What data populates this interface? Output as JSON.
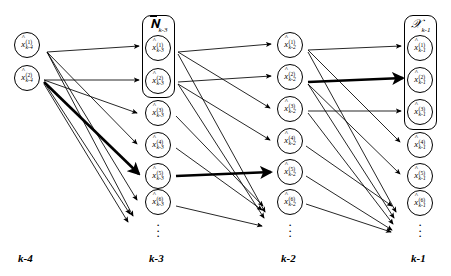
{
  "figure": {
    "width": 451,
    "height": 276,
    "background": "#ffffff",
    "stroke": "#000000"
  },
  "columns": [
    {
      "key": "k-4",
      "axis_label": "k-4",
      "x": 27,
      "label_x": 18,
      "label_y": 252,
      "group": null,
      "has_ellipsis": false,
      "nodes": [
        {
          "index": "1",
          "time": "k-4",
          "symbol": "x",
          "accent": "hat",
          "cx": 27,
          "cy": 45
        },
        {
          "index": "2",
          "time": "k-4",
          "symbol": "x",
          "accent": "hat",
          "cx": 27,
          "cy": 78
        }
      ]
    },
    {
      "key": "k-3",
      "axis_label": "k-3",
      "x": 158,
      "label_x": 149,
      "label_y": 252,
      "group": {
        "label": "N",
        "label_accent": "overbar",
        "subscript": "k-3",
        "covers": [
          1,
          2
        ],
        "box_x": 142,
        "box_y": 15,
        "box_w": 33,
        "box_h": 83
      },
      "has_ellipsis": true,
      "ellipsis_y": 219,
      "nodes": [
        {
          "index": "1",
          "time": "k-3",
          "symbol": "x",
          "accent": "hat",
          "cx": 158,
          "cy": 48
        },
        {
          "index": "2",
          "time": "k-3",
          "symbol": "x",
          "accent": "hat",
          "cx": 158,
          "cy": 81
        },
        {
          "index": "3",
          "time": "k-3",
          "symbol": "x",
          "accent": "hat",
          "cx": 158,
          "cy": 113
        },
        {
          "index": "4",
          "time": "k-3",
          "symbol": "x",
          "accent": "hat",
          "cx": 158,
          "cy": 145
        },
        {
          "index": "5",
          "time": "k-3",
          "symbol": "x",
          "accent": "hat",
          "cx": 158,
          "cy": 176
        },
        {
          "index": "6",
          "time": "k-3",
          "symbol": "x",
          "accent": "hat",
          "cx": 158,
          "cy": 202
        }
      ]
    },
    {
      "key": "k-2",
      "axis_label": "k-2",
      "x": 290,
      "label_x": 281,
      "label_y": 252,
      "group": null,
      "has_ellipsis": true,
      "ellipsis_y": 219,
      "nodes": [
        {
          "index": "1",
          "time": "k-2",
          "symbol": "x",
          "accent": "hat",
          "cx": 290,
          "cy": 45
        },
        {
          "index": "2",
          "time": "k-2",
          "symbol": "x",
          "accent": "hat",
          "cx": 290,
          "cy": 77
        },
        {
          "index": "3",
          "time": "k-2",
          "symbol": "x",
          "accent": "hat",
          "cx": 290,
          "cy": 109
        },
        {
          "index": "4",
          "time": "k-2",
          "symbol": "x",
          "accent": "hat",
          "cx": 290,
          "cy": 141
        },
        {
          "index": "5",
          "time": "k-2",
          "symbol": "x",
          "accent": "hat",
          "cx": 290,
          "cy": 172
        },
        {
          "index": "6",
          "time": "k-2",
          "symbol": "x",
          "accent": "hat",
          "cx": 290,
          "cy": 202
        }
      ]
    },
    {
      "key": "k-1",
      "axis_label": "k-1",
      "x": 420,
      "label_x": 411,
      "label_y": 252,
      "group": {
        "label": "X",
        "label_accent": "script",
        "subscript": "k-1",
        "covers": [
          1,
          2,
          3
        ],
        "box_x": 404,
        "box_y": 15,
        "box_w": 33,
        "box_h": 115
      },
      "has_ellipsis": true,
      "ellipsis_y": 219,
      "nodes": [
        {
          "index": "1",
          "time": "k-1",
          "symbol": "x",
          "accent": "hat",
          "cx": 420,
          "cy": 48
        },
        {
          "index": "2",
          "time": "k-1",
          "symbol": "x",
          "accent": "hat",
          "cx": 420,
          "cy": 80
        },
        {
          "index": "3",
          "time": "k-1",
          "symbol": "x",
          "accent": "hat",
          "cx": 420,
          "cy": 112
        },
        {
          "index": "4",
          "time": "k-1",
          "symbol": "x",
          "accent": "hat",
          "cx": 420,
          "cy": 145
        },
        {
          "index": "5",
          "time": "k-1",
          "symbol": "x",
          "accent": "hat",
          "cx": 420,
          "cy": 176
        },
        {
          "index": "6",
          "time": "k-1",
          "symbol": "x",
          "accent": "hat",
          "cx": 420,
          "cy": 203
        }
      ]
    }
  ],
  "edges": [
    {
      "from": "k-4.1",
      "to": "k-3.1",
      "x1": 47,
      "y1": 52,
      "x2": 139,
      "y2": 46,
      "weight": "thin"
    },
    {
      "from": "k-4.1",
      "to": "k-3.4",
      "x1": 47,
      "y1": 52,
      "x2": 137,
      "y2": 144,
      "weight": "thin"
    },
    {
      "from": "k-4.1",
      "to": "k-3.6",
      "x1": 47,
      "y1": 52,
      "x2": 137,
      "y2": 200,
      "weight": "thin"
    },
    {
      "from": "k-4.1",
      "to": "k-3.below",
      "x1": 47,
      "y1": 52,
      "x2": 133,
      "y2": 216,
      "weight": "thin"
    },
    {
      "from": "k-4.2",
      "to": "k-3.2",
      "x1": 44,
      "y1": 80,
      "x2": 139,
      "y2": 80,
      "weight": "thin"
    },
    {
      "from": "k-4.2",
      "to": "k-3.3",
      "x1": 44,
      "y1": 80,
      "x2": 137,
      "y2": 113,
      "weight": "thin"
    },
    {
      "from": "k-4.2",
      "to": "k-3.5",
      "x1": 44,
      "y1": 82,
      "x2": 139,
      "y2": 174,
      "weight": "thick"
    },
    {
      "from": "k-4.2",
      "to": "k-3.below",
      "x1": 44,
      "y1": 82,
      "x2": 130,
      "y2": 214,
      "weight": "thin"
    },
    {
      "from": "k-4.2",
      "to": "k-3.below2",
      "x1": 44,
      "y1": 84,
      "x2": 128,
      "y2": 222,
      "weight": "thin"
    },
    {
      "from": "k-3.1",
      "to": "k-2.1",
      "x1": 178,
      "y1": 52,
      "x2": 271,
      "y2": 44,
      "weight": "thin"
    },
    {
      "from": "k-3.1",
      "to": "k-2.3",
      "x1": 178,
      "y1": 52,
      "x2": 270,
      "y2": 108,
      "weight": "thin"
    },
    {
      "from": "k-3.1",
      "to": "k-2.below",
      "x1": 178,
      "y1": 54,
      "x2": 265,
      "y2": 212,
      "weight": "thin"
    },
    {
      "from": "k-3.2",
      "to": "k-2.2",
      "x1": 178,
      "y1": 82,
      "x2": 271,
      "y2": 76,
      "weight": "thin"
    },
    {
      "from": "k-3.2",
      "to": "k-2.4",
      "x1": 178,
      "y1": 84,
      "x2": 270,
      "y2": 140,
      "weight": "thin"
    },
    {
      "from": "k-3.2",
      "to": "k-2.below",
      "x1": 178,
      "y1": 84,
      "x2": 264,
      "y2": 218,
      "weight": "thin"
    },
    {
      "from": "k-3.3",
      "to": "k-2.below",
      "x1": 176,
      "y1": 116,
      "x2": 263,
      "y2": 206,
      "weight": "thin"
    },
    {
      "from": "k-3.4",
      "to": "k-2.below",
      "x1": 176,
      "y1": 148,
      "x2": 262,
      "y2": 210,
      "weight": "thin"
    },
    {
      "from": "k-3.5",
      "to": "k-2.5",
      "x1": 176,
      "y1": 176,
      "x2": 271,
      "y2": 172,
      "weight": "thick"
    },
    {
      "from": "k-3.6",
      "to": "k-2.below",
      "x1": 176,
      "y1": 206,
      "x2": 262,
      "y2": 226,
      "weight": "thin"
    },
    {
      "from": "k-2.1",
      "to": "k-1.1",
      "x1": 308,
      "y1": 50,
      "x2": 401,
      "y2": 46,
      "weight": "thin"
    },
    {
      "from": "k-2.1",
      "to": "k-1.4",
      "x1": 308,
      "y1": 50,
      "x2": 400,
      "y2": 142,
      "weight": "thin"
    },
    {
      "from": "k-2.1",
      "to": "k-1.below",
      "x1": 308,
      "y1": 52,
      "x2": 396,
      "y2": 212,
      "weight": "thin"
    },
    {
      "from": "k-2.2",
      "to": "k-1.2",
      "x1": 308,
      "y1": 82,
      "x2": 403,
      "y2": 78,
      "weight": "thick"
    },
    {
      "from": "k-2.2",
      "to": "k-1.5",
      "x1": 308,
      "y1": 84,
      "x2": 400,
      "y2": 174,
      "weight": "thin"
    },
    {
      "from": "k-2.2",
      "to": "k-1.below",
      "x1": 308,
      "y1": 84,
      "x2": 394,
      "y2": 218,
      "weight": "thin"
    },
    {
      "from": "k-2.3",
      "to": "k-1.3",
      "x1": 308,
      "y1": 111,
      "x2": 401,
      "y2": 111,
      "weight": "thin"
    },
    {
      "from": "k-2.3",
      "to": "k-1.below",
      "x1": 308,
      "y1": 113,
      "x2": 393,
      "y2": 224,
      "weight": "thin"
    },
    {
      "from": "k-2.4",
      "to": "k-1.below",
      "x1": 306,
      "y1": 146,
      "x2": 392,
      "y2": 206,
      "weight": "thin"
    },
    {
      "from": "k-2.5",
      "to": "k-1.below",
      "x1": 306,
      "y1": 176,
      "x2": 392,
      "y2": 230,
      "weight": "thin"
    },
    {
      "from": "k-2.6",
      "to": "k-1.below",
      "x1": 306,
      "y1": 204,
      "x2": 391,
      "y2": 232,
      "weight": "thin"
    }
  ]
}
